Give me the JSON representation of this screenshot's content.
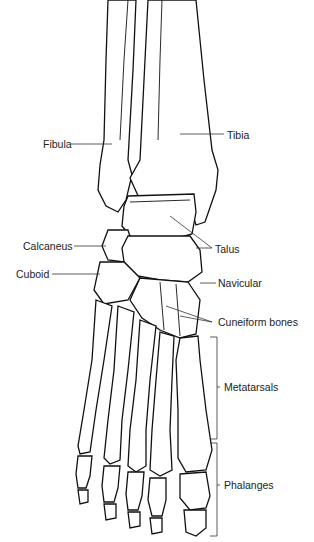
{
  "diagram": {
    "labels": {
      "fibula": "Fibula",
      "tibia": "Tibia",
      "calcaneus": "Calcaneus",
      "talus": "Talus",
      "cuboid": "Cuboid",
      "navicular": "Navicular",
      "cuneiform": "Cuneiform bones",
      "metatarsals": "Metatarsals",
      "phalanges": "Phalanges"
    },
    "colors": {
      "background": "#ffffff",
      "line": "#111111",
      "text": "#222222"
    }
  }
}
